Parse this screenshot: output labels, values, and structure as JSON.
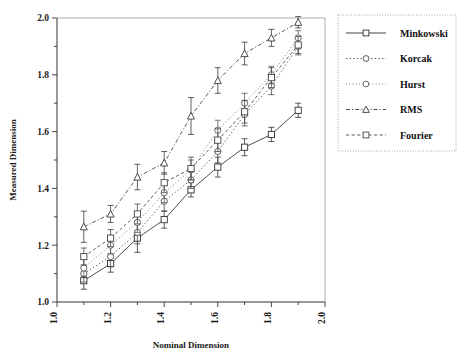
{
  "chart_data": {
    "type": "line",
    "title": "",
    "xlabel": "Nominal Dimension",
    "ylabel": "Measured Dimension",
    "xlim": [
      1.0,
      2.0
    ],
    "ylim": [
      1.0,
      2.0
    ],
    "xticks": [
      "1.0",
      "1.2",
      "1.4",
      "1.6",
      "1.8",
      "2.0"
    ],
    "xtick_values": [
      1.0,
      1.2,
      1.4,
      1.6,
      1.8,
      2.0
    ],
    "yticks": [
      "1.0",
      "1.2",
      "1.4",
      "1.6",
      "1.8",
      "2.0"
    ],
    "ytick_values": [
      1.0,
      1.2,
      1.4,
      1.6,
      1.8,
      2.0
    ],
    "minor_tick_step": 0.1,
    "grid": false,
    "legend_position": "right",
    "errorbars": true,
    "x": [
      1.1,
      1.2,
      1.3,
      1.4,
      1.5,
      1.6,
      1.7,
      1.8,
      1.9
    ],
    "series": [
      {
        "name": "Minkowski",
        "marker": "square",
        "linestyle": "solid",
        "color": "#303030",
        "values": [
          1.075,
          1.135,
          1.225,
          1.29,
          1.395,
          1.475,
          1.545,
          1.59,
          1.675
        ],
        "errors": [
          0.03,
          0.03,
          0.05,
          0.03,
          0.025,
          0.035,
          0.03,
          0.025,
          0.025
        ]
      },
      {
        "name": "Korcak",
        "marker": "circle",
        "linestyle": "dotted",
        "color": "#4a4a4a",
        "values": [
          1.1,
          1.16,
          1.245,
          1.355,
          1.43,
          1.53,
          1.66,
          1.76,
          1.9
        ],
        "errors": [
          0.03,
          0.035,
          0.04,
          0.035,
          0.03,
          0.04,
          0.04,
          0.03,
          0.03
        ]
      },
      {
        "name": "Hurst",
        "marker": "circle",
        "linestyle": "fine-dotted",
        "color": "#5a5a5a",
        "values": [
          1.12,
          1.2,
          1.28,
          1.385,
          1.465,
          1.605,
          1.7,
          1.8,
          1.93
        ],
        "errors": [
          0.03,
          0.03,
          0.035,
          0.035,
          0.035,
          0.035,
          0.035,
          0.03,
          0.025
        ]
      },
      {
        "name": "RMS",
        "marker": "triangle",
        "linestyle": "dash-dot",
        "color": "#3a3a3a",
        "values": [
          1.265,
          1.31,
          1.44,
          1.49,
          1.655,
          1.78,
          1.875,
          1.93,
          1.985
        ],
        "errors": [
          0.055,
          0.03,
          0.045,
          0.04,
          0.065,
          0.045,
          0.04,
          0.03,
          0.02
        ]
      },
      {
        "name": "Fourier",
        "marker": "square",
        "linestyle": "dashed",
        "color": "#454545",
        "values": [
          1.16,
          1.225,
          1.31,
          1.42,
          1.47,
          1.57,
          1.67,
          1.79,
          1.905
        ],
        "errors": [
          0.03,
          0.03,
          0.035,
          0.035,
          0.04,
          0.04,
          0.04,
          0.035,
          0.03
        ]
      }
    ]
  },
  "legend": {
    "items": [
      {
        "label": "Minkowski"
      },
      {
        "label": "Korcak"
      },
      {
        "label": "Hurst"
      },
      {
        "label": "RMS"
      },
      {
        "label": "Fourier"
      }
    ]
  },
  "axes": {
    "x_label": "Nominal Dimension",
    "y_label": "Measured Dimension"
  }
}
